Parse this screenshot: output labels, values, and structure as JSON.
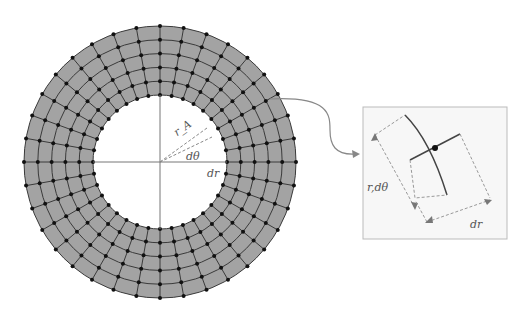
{
  "diagram": {
    "annulus": {
      "center": [
        160,
        162
      ],
      "outer_radius": 136,
      "inner_radius": 67,
      "radial_rings": 5,
      "angular_divisions": 36,
      "fill_color": "#a3a3a3",
      "grid_color": "#3a3a3a",
      "node_color": "#111111"
    },
    "labels": {
      "radius": "r_A",
      "angle": "dθ",
      "radial_step": "dr"
    },
    "inset": {
      "labels": {
        "arc_length": "r,dθ",
        "radial_step": "dr"
      },
      "border_color": "#bbbbbb",
      "background": "#f7f7f7"
    },
    "connector": {
      "color": "#888888"
    }
  }
}
